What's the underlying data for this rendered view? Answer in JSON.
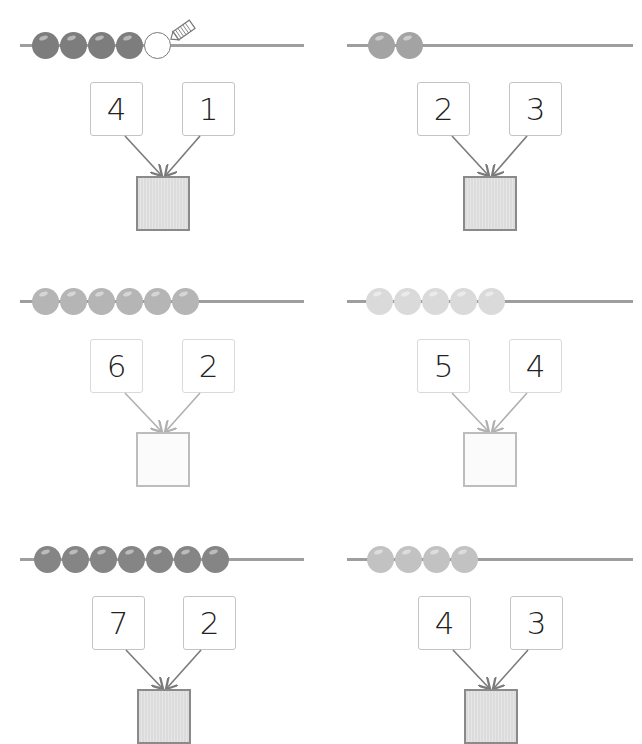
{
  "worksheet": {
    "problems": [
      {
        "id": "p1",
        "beads": 4,
        "bead_color": "#7d7d7d",
        "empty_beads": 1,
        "has_pencil": true,
        "addend_a": "4",
        "addend_b": "1",
        "result": "",
        "result_style": "striped",
        "arrow_color": "#7a7a7a"
      },
      {
        "id": "p2",
        "beads": 2,
        "bead_color": "#a3a3a3",
        "empty_beads": 0,
        "has_pencil": false,
        "addend_a": "2",
        "addend_b": "3",
        "result": "",
        "result_style": "striped",
        "arrow_color": "#7a7a7a"
      },
      {
        "id": "p3",
        "beads": 6,
        "bead_color": "#b5b5b5",
        "empty_beads": 0,
        "has_pencil": false,
        "addend_a": "6",
        "addend_b": "2",
        "result": "",
        "result_style": "light",
        "arrow_color": "#b0b0b0"
      },
      {
        "id": "p4",
        "beads": 5,
        "bead_color": "#dadada",
        "empty_beads": 0,
        "has_pencil": false,
        "addend_a": "5",
        "addend_b": "4",
        "result": "",
        "result_style": "light",
        "arrow_color": "#b0b0b0"
      },
      {
        "id": "p5",
        "beads": 7,
        "bead_color": "#858585",
        "empty_beads": 0,
        "has_pencil": false,
        "addend_a": "7",
        "addend_b": "2",
        "result": "",
        "result_style": "striped",
        "arrow_color": "#7a7a7a"
      },
      {
        "id": "p6",
        "beads": 4,
        "bead_color": "#c2c2c2",
        "empty_beads": 0,
        "has_pencil": false,
        "addend_a": "4",
        "addend_b": "3",
        "result": "",
        "result_style": "striped",
        "arrow_color": "#7a7a7a"
      }
    ],
    "icons": {
      "pencil": "pencil-icon",
      "bead": "bead-icon"
    }
  }
}
